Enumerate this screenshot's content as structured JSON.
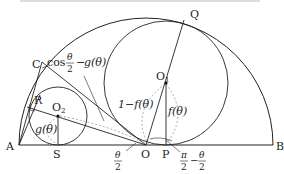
{
  "diagram": {
    "type": "geometry",
    "points": {
      "A": "A",
      "B": "B",
      "C": "C",
      "O": "O",
      "P": "P",
      "Q": "Q",
      "R": "R",
      "S": "S",
      "O1": "O",
      "O1_sub": "1",
      "O2": "O",
      "O2_sub": "2"
    },
    "labels": {
      "cos": "cos",
      "theta": "θ",
      "two": "2",
      "minus": "−",
      "g_theta": "g(θ)",
      "f_theta": "f(θ)",
      "one_minus_f": "1−f(θ)",
      "pi": "π",
      "pi_half_minus": "−"
    },
    "colors": {
      "stroke": "#222222",
      "dashed": "#888888",
      "background": "#ffffff"
    }
  }
}
